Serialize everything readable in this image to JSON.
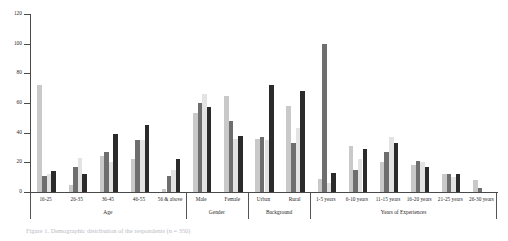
{
  "figure": {
    "caption": "Figure 1. Demographic distribution of the respondents (n = 350)"
  },
  "chart_data": {
    "type": "bar",
    "title": "",
    "xlabel": "",
    "ylabel": "",
    "ylim": [
      0,
      120
    ],
    "yticks": [
      0,
      20,
      40,
      60,
      80,
      100,
      120
    ],
    "grid": false,
    "legend": "none",
    "orientation": "vertical",
    "groups": [
      {
        "name": "Age",
        "categories": [
          "16-25",
          "26-35",
          "36-45",
          "46-55",
          "56 & above"
        ]
      },
      {
        "name": "Gender",
        "categories": [
          "Male",
          "Female"
        ]
      },
      {
        "name": "Background",
        "categories": [
          "Urban",
          "Rural"
        ]
      },
      {
        "name": "Years of Experiences",
        "categories": [
          "1-5 years",
          "6-10 years",
          "11-15 years",
          "16-20 years",
          "21-25 years",
          "26-30 years"
        ]
      }
    ],
    "categories": [
      "16-25",
      "26-35",
      "36-45",
      "46-55",
      "56 & above",
      "Male",
      "Female",
      "Urban",
      "Rural",
      "1-5 years",
      "6-10 years",
      "11-15 years",
      "16-20 years",
      "21-25 years",
      "26-30 years"
    ],
    "series": [
      {
        "name": "Series 1",
        "color": "#c9c9c9",
        "values": [
          72,
          5,
          24,
          22,
          2,
          53,
          65,
          36,
          58,
          9,
          31,
          20,
          18,
          12,
          8
        ]
      },
      {
        "name": "Series 2",
        "color": "#6e6e6e",
        "values": [
          11,
          17,
          27,
          35,
          11,
          60,
          48,
          37,
          33,
          100,
          15,
          27,
          21,
          12,
          3
        ]
      },
      {
        "name": "Series 3",
        "color": "#e3e3e3",
        "values": [
          12,
          23,
          20,
          35,
          15,
          66,
          36,
          35,
          43,
          6,
          22,
          37,
          20,
          10,
          0
        ]
      },
      {
        "name": "Series 4",
        "color": "#2b2b2b",
        "values": [
          14,
          12,
          39,
          45,
          22,
          57,
          38,
          72,
          68,
          13,
          29,
          33,
          17,
          12,
          0
        ]
      }
    ],
    "y_tick_labels": [
      "0",
      "20",
      "40",
      "60",
      "80",
      "100",
      "120"
    ]
  }
}
